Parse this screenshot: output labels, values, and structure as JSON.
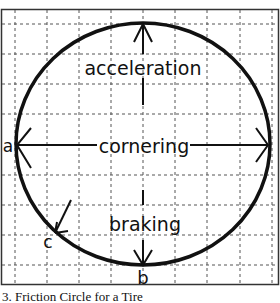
{
  "diagram": {
    "type": "friction-circle",
    "labels": {
      "acceleration": "acceleration",
      "cornering": "cornering",
      "braking": "braking",
      "point_a": "a",
      "point_b": "b",
      "point_c": "c"
    },
    "grid": {
      "vertical_x": [
        15,
        47,
        79,
        111,
        143,
        175,
        207,
        240,
        272
      ],
      "horizontal_y": [
        24,
        54,
        84,
        114,
        144,
        175,
        205,
        235,
        265
      ],
      "style": "dashed"
    },
    "circle": {
      "cx": 143,
      "cy": 144,
      "rx": 127,
      "ry": 121
    },
    "colors": {
      "line": "#111111",
      "grid": "#555555",
      "background": "#ffffff"
    }
  },
  "caption": "3. Friction Circle for a Tire"
}
